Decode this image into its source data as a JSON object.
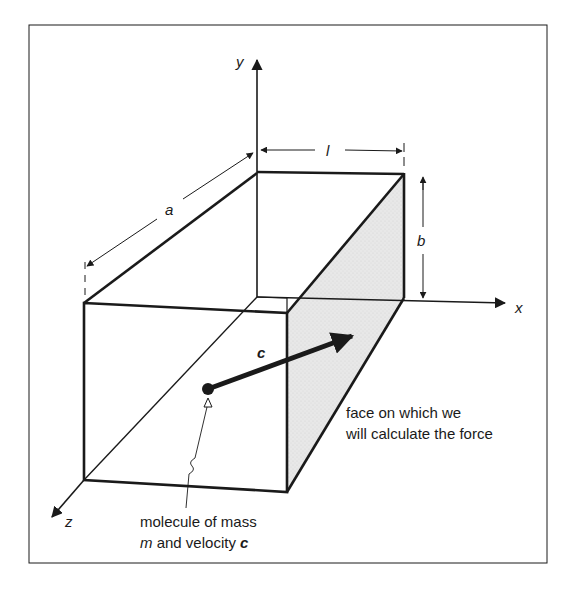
{
  "figure": {
    "type": "3d-box-diagram",
    "axes": {
      "x_label": "x",
      "y_label": "y",
      "z_label": "z"
    },
    "dimensions": {
      "length_label": "l",
      "width_label": "a",
      "height_label": "b"
    },
    "vector": {
      "label": "c"
    },
    "annotations": {
      "face": {
        "line1": "face on which we",
        "line2": "will calculate the force"
      },
      "molecule": {
        "line1": "molecule of mass",
        "line2_italic": "m",
        "line2_text": " and velocity ",
        "line2_bold": "c"
      }
    },
    "colors": {
      "stroke": "#1a1a1a",
      "shaded_face": "#e6e6e6",
      "background": "#ffffff"
    }
  }
}
